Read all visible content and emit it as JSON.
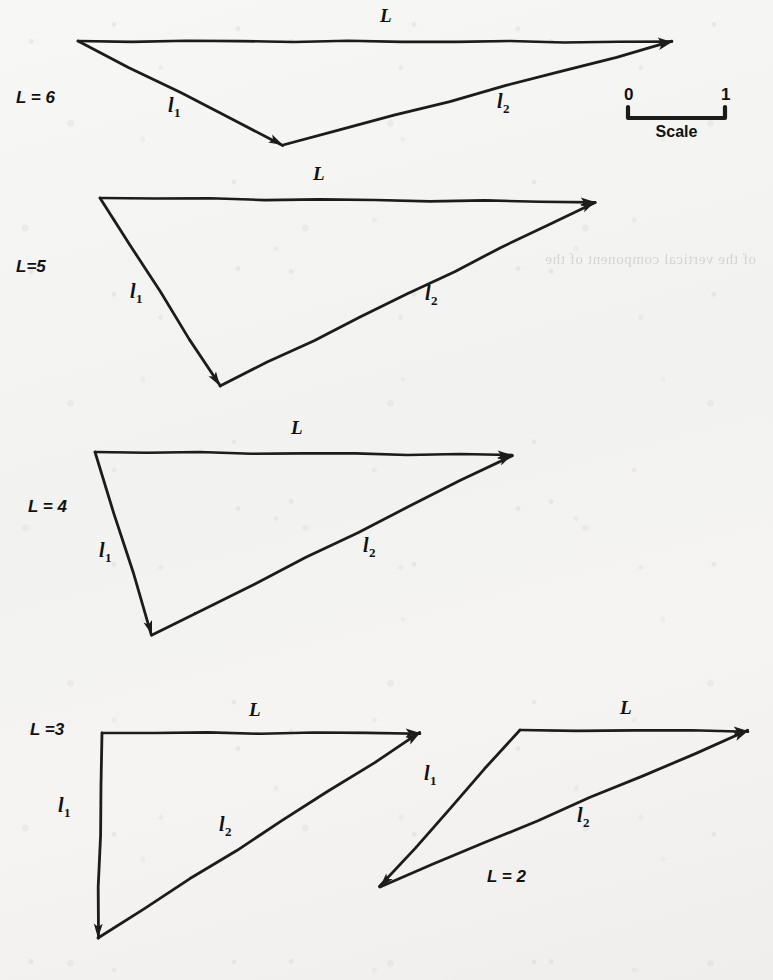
{
  "figure": {
    "kind": "vector-triangle-diagrams",
    "background_color": "#f4f4f3",
    "ink_color": "#1b1b1b",
    "scale_bar": {
      "left_label": "0",
      "right_label": "1",
      "caption": "Scale",
      "x_start": 628,
      "x_end": 725,
      "y": 118
    },
    "bleed_through_text": "of the vertical component of the",
    "diagrams": [
      {
        "id": "L6",
        "case_label": "L = 6",
        "case_label_x": 16,
        "case_label_y": 103,
        "resultant_label": "L",
        "component1_label": "l",
        "component1_sub": "1",
        "component2_label": "l",
        "component2_sub": "2",
        "apex": [
          78,
          41
        ],
        "right_tip": [
          672,
          42
        ],
        "bottom": [
          283,
          145
        ],
        "L_label_xy": [
          380,
          22
        ],
        "l1_label_xy": [
          168,
          112
        ],
        "l2_label_xy": [
          497,
          108
        ]
      },
      {
        "id": "L5",
        "case_label": "L=5",
        "case_label_x": 16,
        "case_label_y": 272,
        "resultant_label": "L",
        "component1_label": "l",
        "component1_sub": "1",
        "component2_label": "l",
        "component2_sub": "2",
        "apex": [
          100,
          198
        ],
        "right_tip": [
          595,
          202
        ],
        "bottom": [
          220,
          386
        ],
        "L_label_xy": [
          313,
          180
        ],
        "l1_label_xy": [
          130,
          298
        ],
        "l2_label_xy": [
          425,
          300
        ]
      },
      {
        "id": "L4",
        "case_label": "L = 4",
        "case_label_x": 28,
        "case_label_y": 512,
        "resultant_label": "L",
        "component1_label": "l",
        "component1_sub": "1",
        "component2_label": "l",
        "component2_sub": "2",
        "apex": [
          95,
          452
        ],
        "right_tip": [
          512,
          455
        ],
        "bottom": [
          152,
          635
        ],
        "L_label_xy": [
          291,
          434
        ],
        "l1_label_xy": [
          99,
          557
        ],
        "l2_label_xy": [
          363,
          552
        ]
      },
      {
        "id": "L3",
        "case_label": "L =3",
        "case_label_x": 30,
        "case_label_y": 735,
        "resultant_label": "L",
        "component1_label": "l",
        "component1_sub": "1",
        "component2_label": "l",
        "component2_sub": "2",
        "apex": [
          102,
          733
        ],
        "right_tip": [
          420,
          733
        ],
        "bottom": [
          98,
          938
        ],
        "L_label_xy": [
          249,
          716
        ],
        "l1_label_xy": [
          58,
          812
        ],
        "l2_label_xy": [
          219,
          831
        ]
      },
      {
        "id": "L2",
        "case_label": "L = 2",
        "case_label_x": 487,
        "case_label_y": 882,
        "resultant_label": "L",
        "component1_label": "l",
        "component1_sub": "1",
        "component2_label": "l",
        "component2_sub": "2",
        "apex": [
          520,
          730
        ],
        "right_tip": [
          748,
          731
        ],
        "bottom": [
          380,
          887
        ],
        "L_label_xy": [
          620,
          714
        ],
        "l1_label_xy": [
          424,
          780
        ],
        "l2_label_xy": [
          577,
          822
        ]
      }
    ]
  }
}
